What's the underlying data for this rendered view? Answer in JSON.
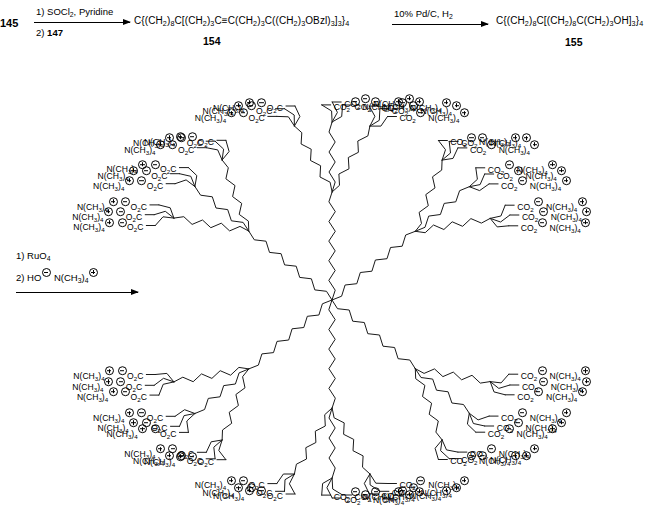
{
  "scheme": {
    "title_absent": true,
    "steps": [
      {
        "id": "step1",
        "start_label": "145",
        "conditions": [
          "1) SOCl2,  Pyridine",
          "2) 147"
        ],
        "condition_line1_parts": {
          "pre": "1) SOCl",
          "sub": "2",
          "post": ",  Pyridine"
        },
        "condition_line2_parts": {
          "pre": "2) ",
          "bold": "147"
        },
        "product_formula": "C{(CH2)8C[(CH2)3C≡C(CH2)3C((CH2)3OBzl)3]3}4",
        "product_number": "154"
      },
      {
        "id": "step2",
        "conditions": [
          "10% Pd/C,  H2"
        ],
        "product_formula": "C{(CH2)8C[(CH2)8C(CH2)3OH]3}4",
        "product_number": "155"
      },
      {
        "id": "step3",
        "conditions": [
          "1) RuO4",
          "2) HO⊖ N(CH3)4⊕"
        ],
        "condition_line1_parts": {
          "pre": "1) RuO",
          "sub": "4"
        },
        "condition_line2_parts": {
          "pre": "2) HO",
          "charge1": "⊖",
          "mid": " N(CH",
          "sub1": "3",
          "close": ")",
          "sub2": "4",
          "charge2": "⊕"
        },
        "product": "dendrimer-polycarboxylate"
      }
    ]
  },
  "dendrimer": {
    "name": "poly(tetramethylammonium carboxylate) dendrimer",
    "core": "C",
    "terminal_group_left": "⊖O2C",
    "terminal_group_right": "CO2⊖",
    "counterion": "N(CH3)4⊕",
    "terminal_count": 36,
    "label_parts": {
      "carboxylate_pre": "O",
      "carboxylate_sub": "2",
      "carboxylate_post": "C",
      "counterion_pre": "N(CH",
      "counterion_sub1": "3",
      "counterion_mid": ")",
      "counterion_sub2": "4"
    }
  },
  "colors": {
    "background": "#ffffff",
    "bond": "#1a1a1a",
    "text": "#000000"
  }
}
